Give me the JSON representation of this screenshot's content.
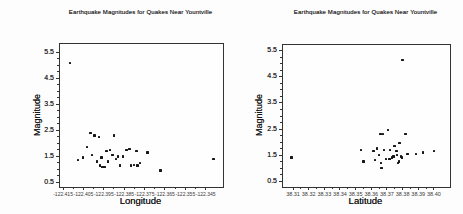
{
  "chart_data": [
    {
      "type": "scatter",
      "title": "Earthquake Magnitudes for Quakes Near Yountville",
      "xlabel": "Longitude",
      "ylabel": "Magnitude",
      "xlim": [
        -122.4165,
        -122.3365
      ],
      "ylim": [
        0.32,
        5.82
      ],
      "x_ticks": [
        -122.415,
        -122.405,
        -122.395,
        -122.385,
        -122.375,
        -122.365,
        -122.355,
        -122.345
      ],
      "x_tick_labels": [
        "-122.415",
        "-122.405",
        "-122.395",
        "-122.385",
        "-122.375",
        "-122.365",
        "-122.355",
        "-122.345"
      ],
      "y_ticks": [
        0.5,
        1.5,
        2.5,
        3.5,
        4.5,
        5.5
      ],
      "y_tick_labels": [
        "0.5",
        "1.5",
        "2.5",
        "3.5",
        "4.5",
        "5.5"
      ],
      "y_minor_step": 0.25,
      "grid": false,
      "legend": null,
      "frame_color": "#333333",
      "marker": {
        "shape": "square",
        "color": "#161616",
        "size": 2.4
      },
      "points": [
        [
          -122.4117,
          5.1
        ],
        [
          -122.4078,
          1.35
        ],
        [
          -122.4053,
          1.45
        ],
        [
          -122.4033,
          1.85
        ],
        [
          -122.4015,
          2.4
        ],
        [
          -122.4008,
          1.55
        ],
        [
          -122.3995,
          2.3
        ],
        [
          -122.3983,
          1.3
        ],
        [
          -122.3975,
          2.25
        ],
        [
          -122.397,
          1.15
        ],
        [
          -122.3962,
          1.45
        ],
        [
          -122.3957,
          1.1
        ],
        [
          -122.3946,
          1.1
        ],
        [
          -122.3936,
          1.7
        ],
        [
          -122.3929,
          1.3
        ],
        [
          -122.3921,
          1.75
        ],
        [
          -122.3908,
          1.55
        ],
        [
          -122.39,
          2.3
        ],
        [
          -122.389,
          1.4
        ],
        [
          -122.388,
          1.5
        ],
        [
          -122.387,
          1.15
        ],
        [
          -122.3857,
          1.5
        ],
        [
          -122.3839,
          1.75
        ],
        [
          -122.3823,
          1.77
        ],
        [
          -122.3818,
          1.15
        ],
        [
          -122.3803,
          1.17
        ],
        [
          -122.379,
          1.7
        ],
        [
          -122.3785,
          1.15
        ],
        [
          -122.3772,
          1.25
        ],
        [
          -122.3736,
          1.65
        ],
        [
          -122.3672,
          0.95
        ],
        [
          -122.3411,
          1.4
        ]
      ]
    },
    {
      "type": "scatter",
      "title": "Earthquake Magnitudes for Quakes Near Yountville",
      "xlabel": "Latitude",
      "ylabel": "Magnitude",
      "xlim": [
        38.3036,
        38.4103
      ],
      "ylim": [
        0.27,
        5.73
      ],
      "x_ticks": [
        38.31,
        38.32,
        38.33,
        38.34,
        38.35,
        38.36,
        38.37,
        38.38,
        38.39,
        38.4
      ],
      "x_tick_labels": [
        "38.31",
        "38.32",
        "38.33",
        "38.34",
        "38.35",
        "38.36",
        "38.37",
        "38.38",
        "38.39",
        "38.40"
      ],
      "y_ticks": [
        0.5,
        1.5,
        2.5,
        3.5,
        4.5,
        5.5
      ],
      "y_tick_labels": [
        "0.5",
        "1.5",
        "2.5",
        "3.5",
        "4.5",
        "5.5"
      ],
      "y_minor_step": 0.25,
      "grid": false,
      "legend": null,
      "frame_color": "#333333",
      "marker": {
        "shape": "square",
        "color": "#161616",
        "size": 2.4
      },
      "points": [
        [
          38.38,
          5.15
        ],
        [
          38.309,
          1.4
        ],
        [
          38.3536,
          1.7
        ],
        [
          38.3551,
          1.25
        ],
        [
          38.3615,
          1.65
        ],
        [
          38.3624,
          1.3
        ],
        [
          38.3638,
          1.75
        ],
        [
          38.3658,
          2.3
        ],
        [
          38.3675,
          2.3
        ],
        [
          38.3649,
          1.5
        ],
        [
          38.3664,
          1.2
        ],
        [
          38.3666,
          1.0
        ],
        [
          38.3681,
          1.7
        ],
        [
          38.3696,
          1.35
        ],
        [
          38.3707,
          2.45
        ],
        [
          38.3717,
          1.35
        ],
        [
          38.3721,
          1.7
        ],
        [
          38.3732,
          1.4
        ],
        [
          38.3743,
          1.45
        ],
        [
          38.3749,
          1.85
        ],
        [
          38.376,
          1.65
        ],
        [
          38.3766,
          1.5
        ],
        [
          38.377,
          1.2
        ],
        [
          38.3777,
          1.25
        ],
        [
          38.3781,
          1.95
        ],
        [
          38.3791,
          1.45
        ],
        [
          38.3798,
          1.4
        ],
        [
          38.3819,
          2.3
        ],
        [
          38.3832,
          1.55
        ],
        [
          38.3887,
          1.55
        ],
        [
          38.393,
          1.6
        ],
        [
          38.4,
          1.65
        ]
      ]
    }
  ]
}
